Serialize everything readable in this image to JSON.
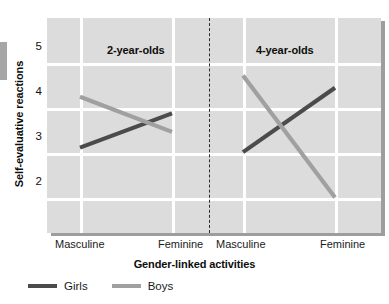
{
  "chart_data": {
    "type": "line",
    "title": "",
    "xlabel": "Gender-linked activities",
    "ylabel": "Self-evaluative reactions",
    "ylim": [
      1.4,
      5.6
    ],
    "yticks": [
      2,
      3,
      4,
      5
    ],
    "ytick_labels": [
      "2",
      "3",
      "4",
      "5"
    ],
    "grid": true,
    "legend_position": "bottom-left",
    "panels": [
      {
        "label": "2-year-olds",
        "x": [
          "Masculine",
          "Feminine"
        ],
        "series": [
          {
            "name": "Girls",
            "values": [
              3.12,
              3.88
            ]
          },
          {
            "name": "Boys",
            "values": [
              4.25,
              3.47
            ]
          }
        ]
      },
      {
        "label": "4-year-olds",
        "x": [
          "Masculine",
          "Feminine"
        ],
        "series": [
          {
            "name": "Girls",
            "values": [
              3.02,
              4.45
            ]
          },
          {
            "name": "Boys",
            "values": [
              4.72,
              2.01
            ]
          }
        ]
      }
    ],
    "series_colors": {
      "Girls": "#4b4b4b",
      "Boys": "#a0a0a0"
    }
  },
  "axes": {
    "y_title": "Self-evaluative reactions",
    "x_title": "Gender-linked activities",
    "y_ticks": [
      "5",
      "4",
      "3",
      "2"
    ],
    "x_ticks": [
      "Masculine",
      "Feminine",
      "Masculine",
      "Feminine"
    ]
  },
  "panels": {
    "left_title": "2-year-olds",
    "right_title": "4-year-olds"
  },
  "legend": {
    "items": [
      {
        "label": "Girls",
        "color": "#4b4b4b"
      },
      {
        "label": "Boys",
        "color": "#a0a0a0"
      }
    ]
  },
  "colors": {
    "plot_background": "#dcdcdc",
    "gridline": "#ffffff",
    "shadow": "#9d9d9d",
    "divider": "#2b2b2b",
    "girls": "#4b4b4b",
    "boys": "#a0a0a0"
  }
}
